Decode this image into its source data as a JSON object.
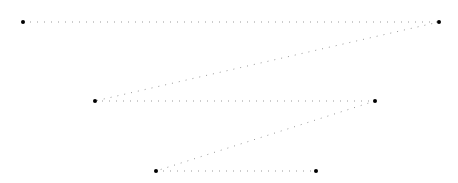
{
  "diagram": {
    "canvas": {
      "width": 458,
      "height": 183,
      "background": "#ffffff"
    },
    "line_color": "#999999",
    "point_color": "#000000",
    "points": [
      {
        "x": 23,
        "y": 22
      },
      {
        "x": 439,
        "y": 22
      },
      {
        "x": 95,
        "y": 101
      },
      {
        "x": 375,
        "y": 101
      },
      {
        "x": 156,
        "y": 171
      },
      {
        "x": 316,
        "y": 171
      }
    ]
  }
}
